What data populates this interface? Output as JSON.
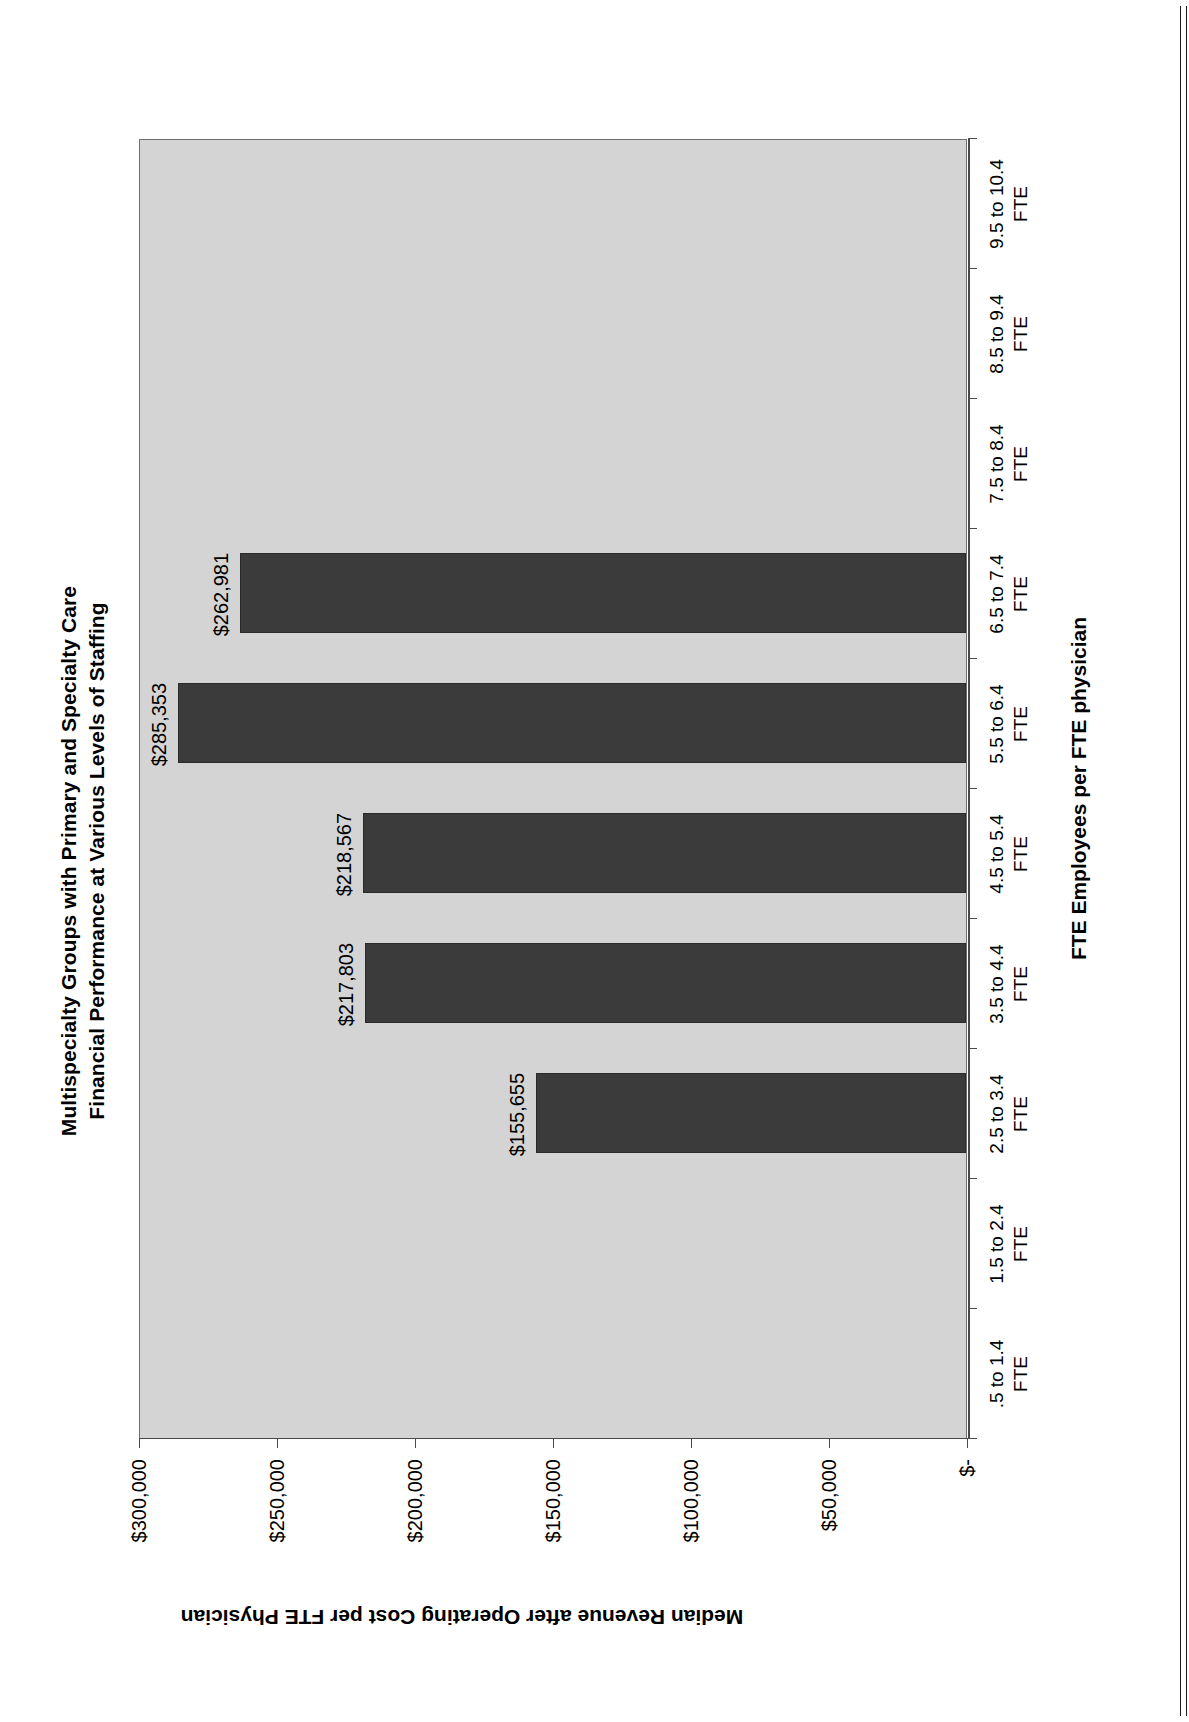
{
  "chart_data": {
    "type": "bar",
    "orientation": "vertical",
    "title": "Multispecialty Groups with Primary and Specialty Care Financial Performance at Various Levels of Staffing",
    "title_line1": "Multispecialty Groups with Primary and Specialty Care",
    "title_line2": "Financial Performance at Various Levels of Staffing",
    "xlabel": "FTE Employees per FTE physician",
    "ylabel": "Median Revenue after Operating Cost per FTE Physician",
    "categories": [
      ".5 to 1.4 FTE",
      "1.5 to 2.4 FTE",
      "2.5 to 3.4 FTE",
      "3.5 to 4.4 FTE",
      "4.5 to 5.4 FTE",
      "5.5 to 6.4 FTE",
      "6.5 to 7.4 FTE",
      "7.5 to 8.4 FTE",
      "8.5 to 9.4 FTE",
      "9.5 to 10.4 FTE"
    ],
    "category_lines": [
      [
        ".5 to 1.4",
        "FTE"
      ],
      [
        "1.5 to 2.4",
        "FTE"
      ],
      [
        "2.5 to 3.4",
        "FTE"
      ],
      [
        "3.5 to 4.4",
        "FTE"
      ],
      [
        "4.5 to 5.4",
        "FTE"
      ],
      [
        "5.5 to 6.4",
        "FTE"
      ],
      [
        "6.5 to 7.4",
        "FTE"
      ],
      [
        "7.5 to 8.4",
        "FTE"
      ],
      [
        "8.5 to 9.4",
        "FTE"
      ],
      [
        "9.5 to 10.4",
        "FTE"
      ]
    ],
    "values": [
      null,
      null,
      155655,
      217803,
      218567,
      285353,
      262981,
      null,
      null,
      null
    ],
    "data_labels": [
      "",
      "",
      "$155,655",
      "$217,803",
      "$218,567",
      "$285,353",
      "$262,981",
      "",
      "",
      ""
    ],
    "ytick_labels": [
      "$-",
      "$50,000",
      "$100,000",
      "$150,000",
      "$200,000",
      "$250,000",
      "$300,000"
    ],
    "ytick_values": [
      0,
      50000,
      100000,
      150000,
      200000,
      250000,
      300000
    ],
    "ylim": [
      0,
      300000
    ],
    "grid": false,
    "legend": "none",
    "bar_color": "#3b3b3b",
    "plot_background": "#d4d4d4",
    "axis_color": "#4a4a4a",
    "text_color": "#000000"
  }
}
